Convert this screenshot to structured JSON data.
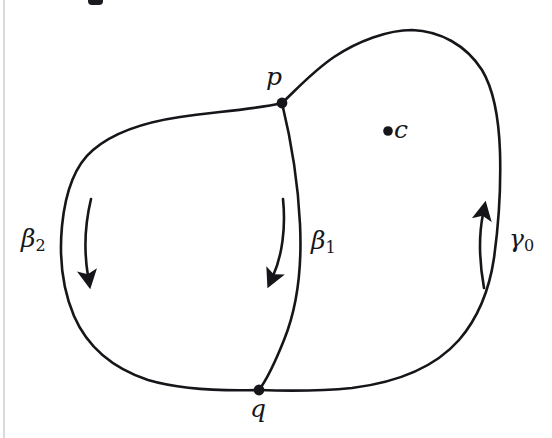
{
  "figure": {
    "type": "topology-diagram",
    "background_color": "#ffffff",
    "stroke_color": "#16161a",
    "points": [
      {
        "id": "p",
        "label": "p",
        "x": 282,
        "y": 103,
        "label_x": 266,
        "label_y": 64
      },
      {
        "id": "q",
        "label": "q",
        "x": 259,
        "y": 390,
        "label_x": 250,
        "label_y": 396
      },
      {
        "id": "c",
        "label": "c",
        "x": 388,
        "y": 131,
        "label_x": 394,
        "label_y": 117
      }
    ],
    "curves": [
      {
        "id": "gamma0",
        "label": "γ0",
        "label_base": "γ",
        "label_sub": "0",
        "label_x": 509,
        "label_y": 226,
        "role": "outer-boundary-right"
      },
      {
        "id": "beta1",
        "label": "β1",
        "label_base": "β",
        "label_sub": "1",
        "label_x": 311,
        "label_y": 228,
        "role": "dividing-arc"
      },
      {
        "id": "beta2",
        "label": "β2",
        "label_base": "β",
        "label_sub": "2",
        "label_x": 21,
        "label_y": 226,
        "role": "left-lobe-boundary"
      }
    ],
    "arrows": [
      {
        "id": "arrow-beta2",
        "direction": "downward",
        "near_curve": "beta2",
        "tip_x": 90,
        "tip_y": 287
      },
      {
        "id": "arrow-beta1",
        "direction": "downward",
        "near_curve": "beta1",
        "tip_x": 274,
        "tip_y": 287
      },
      {
        "id": "arrow-gamma0",
        "direction": "upward",
        "near_curve": "gamma0",
        "tip_x": 483,
        "tip_y": 203
      }
    ]
  }
}
